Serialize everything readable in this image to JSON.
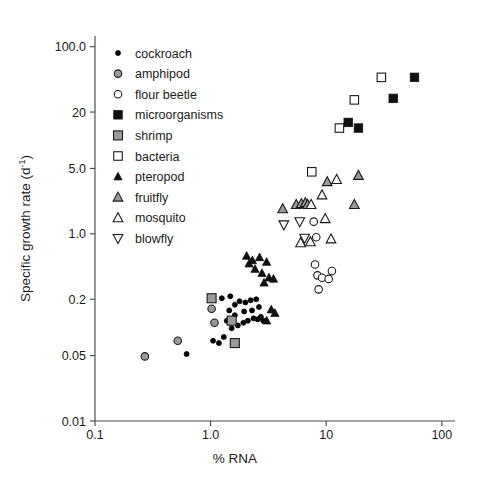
{
  "chart_data": {
    "type": "scatter",
    "title": "",
    "xlabel": "% RNA",
    "ylabel": "Specific growth rate (d-1)",
    "ylabel_base": "Specific growth rate (d",
    "ylabel_sup": "-1",
    "ylabel_tail": ")",
    "xscale": "log",
    "yscale": "log",
    "xlim": [
      0.1,
      130
    ],
    "ylim": [
      0.01,
      130
    ],
    "grid": false,
    "legend_position": "upper-left-inside",
    "xticks": [
      {
        "value": 0.1,
        "label": "0.1"
      },
      {
        "value": 1.0,
        "label": "1.0"
      },
      {
        "value": 10,
        "label": "10"
      },
      {
        "value": 100,
        "label": "100"
      }
    ],
    "yticks": [
      {
        "value": 0.01,
        "label": "0.01"
      },
      {
        "value": 0.05,
        "label": "0.05"
      },
      {
        "value": 0.2,
        "label": "0.2"
      },
      {
        "value": 1.0,
        "label": "1.0"
      },
      {
        "value": 5.0,
        "label": "5.0"
      },
      {
        "value": 20,
        "label": "20"
      },
      {
        "value": 100,
        "label": "100.0"
      }
    ],
    "series": [
      {
        "name": "cockroach",
        "marker": "circle",
        "fill": "#000000",
        "stroke": "#000000",
        "size": 5.0,
        "points": [
          [
            0.62,
            0.052
          ],
          [
            1.05,
            0.072
          ],
          [
            1.18,
            0.068
          ],
          [
            1.3,
            0.079
          ],
          [
            1.52,
            0.098
          ],
          [
            1.72,
            0.105
          ],
          [
            1.92,
            0.112
          ],
          [
            2.1,
            0.118
          ],
          [
            2.35,
            0.125
          ],
          [
            2.55,
            0.122
          ],
          [
            2.72,
            0.13
          ],
          [
            1.45,
            0.152
          ],
          [
            1.62,
            0.175
          ],
          [
            1.78,
            0.19
          ],
          [
            2.0,
            0.185
          ],
          [
            2.22,
            0.195
          ],
          [
            2.48,
            0.2
          ],
          [
            1.95,
            0.148
          ],
          [
            2.28,
            0.152
          ],
          [
            1.38,
            0.118
          ],
          [
            1.62,
            0.135
          ],
          [
            2.62,
            0.165
          ],
          [
            1.25,
            0.205
          ],
          [
            1.48,
            0.215
          ],
          [
            2.85,
            0.118
          ]
        ]
      },
      {
        "name": "amphipod",
        "marker": "circle",
        "fill": "#9a9a9a",
        "stroke": "#1a1a1a",
        "size": 7.5,
        "points": [
          [
            0.27,
            0.049
          ],
          [
            0.52,
            0.072
          ],
          [
            1.02,
            0.158
          ],
          [
            1.08,
            0.112
          ]
        ]
      },
      {
        "name": "flour beetle",
        "marker": "circle",
        "fill": "#ffffff",
        "stroke": "#1a1a1a",
        "size": 7.5,
        "points": [
          [
            8.2,
            0.92
          ],
          [
            8.0,
            0.47
          ],
          [
            8.4,
            0.36
          ],
          [
            9.2,
            0.34
          ],
          [
            8.6,
            0.255
          ],
          [
            11.2,
            0.4
          ],
          [
            10.5,
            0.33
          ],
          [
            7.8,
            1.35
          ]
        ]
      },
      {
        "name": "microorganisms",
        "marker": "square",
        "fill": "#111111",
        "stroke": "#111111",
        "size": 8.5,
        "points": [
          [
            15.5,
            15.5
          ],
          [
            19.0,
            13.5
          ],
          [
            38.0,
            28.0
          ],
          [
            58.0,
            47.0
          ]
        ]
      },
      {
        "name": "shrimp",
        "marker": "square",
        "fill": "#9a9a9a",
        "stroke": "#1a1a1a",
        "size": 9.0,
        "points": [
          [
            1.02,
            0.205
          ],
          [
            1.52,
            0.118
          ],
          [
            1.62,
            0.068
          ]
        ]
      },
      {
        "name": "bacteria",
        "marker": "square",
        "fill": "#ffffff",
        "stroke": "#1a1a1a",
        "size": 8.5,
        "points": [
          [
            7.5,
            4.6
          ],
          [
            13.0,
            13.5
          ],
          [
            17.5,
            27.0
          ],
          [
            30.0,
            47.0
          ]
        ]
      },
      {
        "name": "pteropod",
        "marker": "triangle-up",
        "fill": "#111111",
        "stroke": "#111111",
        "size": 8.0,
        "points": [
          [
            2.05,
            0.58
          ],
          [
            2.15,
            0.48
          ],
          [
            2.3,
            0.52
          ],
          [
            2.42,
            0.42
          ],
          [
            2.65,
            0.56
          ],
          [
            2.78,
            0.38
          ],
          [
            3.05,
            0.5
          ],
          [
            3.2,
            0.34
          ],
          [
            3.5,
            0.33
          ],
          [
            2.9,
            0.3
          ],
          [
            3.35,
            0.155
          ],
          [
            3.6,
            0.142
          ],
          [
            3.05,
            0.118
          ]
        ]
      },
      {
        "name": "fruitfly",
        "marker": "triangle-up",
        "fill": "#9a9a9a",
        "stroke": "#1a1a1a",
        "size": 9.5,
        "points": [
          [
            4.2,
            1.85
          ],
          [
            5.5,
            2.05
          ],
          [
            6.1,
            2.1
          ],
          [
            6.6,
            2.15
          ],
          [
            6.9,
            2.05
          ],
          [
            10.2,
            3.6
          ],
          [
            19.0,
            4.2
          ],
          [
            17.5,
            2.05
          ]
        ]
      },
      {
        "name": "mosquito",
        "marker": "triangle-up",
        "fill": "#ffffff",
        "stroke": "#1a1a1a",
        "size": 9.5,
        "points": [
          [
            7.4,
            2.05
          ],
          [
            9.2,
            2.6
          ],
          [
            9.8,
            1.45
          ],
          [
            11.0,
            0.88
          ],
          [
            6.0,
            0.8
          ],
          [
            7.3,
            0.82
          ],
          [
            12.3,
            3.8
          ]
        ]
      },
      {
        "name": "blowfly",
        "marker": "triangle-down",
        "fill": "#ffffff",
        "stroke": "#1a1a1a",
        "size": 9.5,
        "points": [
          [
            4.3,
            1.25
          ],
          [
            5.9,
            1.35
          ],
          [
            6.5,
            0.9
          ]
        ]
      }
    ],
    "legend_entries": [
      {
        "label": "cockroach",
        "marker": "circle",
        "fill": "#000000",
        "stroke": "#000000",
        "size": 5.0
      },
      {
        "label": "amphipod",
        "marker": "circle",
        "fill": "#9a9a9a",
        "stroke": "#1a1a1a",
        "size": 7.5
      },
      {
        "label": "flour beetle",
        "marker": "circle",
        "fill": "#ffffff",
        "stroke": "#1a1a1a",
        "size": 7.5
      },
      {
        "label": "microorganisms",
        "marker": "square",
        "fill": "#111111",
        "stroke": "#111111",
        "size": 8.5
      },
      {
        "label": "shrimp",
        "marker": "square",
        "fill": "#9a9a9a",
        "stroke": "#1a1a1a",
        "size": 9.0
      },
      {
        "label": "bacteria",
        "marker": "square",
        "fill": "#ffffff",
        "stroke": "#1a1a1a",
        "size": 8.5
      },
      {
        "label": "pteropod",
        "marker": "triangle-up",
        "fill": "#111111",
        "stroke": "#111111",
        "size": 8.0
      },
      {
        "label": "fruitfly",
        "marker": "triangle-up",
        "fill": "#9a9a9a",
        "stroke": "#1a1a1a",
        "size": 9.5
      },
      {
        "label": "mosquito",
        "marker": "triangle-up",
        "fill": "#ffffff",
        "stroke": "#1a1a1a",
        "size": 9.5
      },
      {
        "label": "blowfly",
        "marker": "triangle-down",
        "fill": "#ffffff",
        "stroke": "#1a1a1a",
        "size": 9.5
      }
    ]
  }
}
